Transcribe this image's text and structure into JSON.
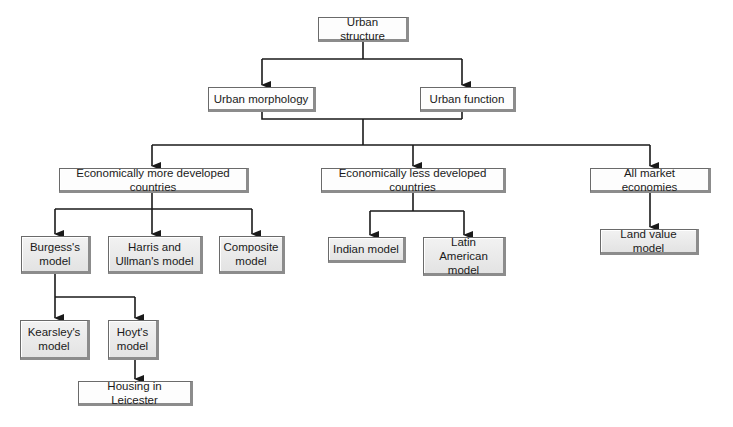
{
  "diagram": {
    "type": "hierarchy-flowchart",
    "colors": {
      "line": "#1a1a1a",
      "box_border": "#6a6a6a",
      "box_shadow": "#8c8c8c",
      "white_box_fill": "#fdfdfd",
      "grey_box_fill": "#e8e8e8",
      "text": "#1a1a1a"
    },
    "nodes": {
      "urban_structure": "Urban structure",
      "urban_morphology": "Urban morphology",
      "urban_function": "Urban function",
      "emdc": "Economically more developed countries",
      "eldc": "Economically less developed countries",
      "all_market": "All market economies",
      "burgess": "Burgess's\nmodel",
      "harris_ullman": "Harris and\nUllman's model",
      "composite": "Composite\nmodel",
      "indian": "Indian model",
      "latin_american": "Latin American\nmodel",
      "land_value": "Land value model",
      "kearsley": "Kearsley's\nmodel",
      "hoyt": "Hoyt's\nmodel",
      "housing_leicester": "Housing in Leicester"
    },
    "edges": [
      [
        "urban_structure",
        "urban_morphology"
      ],
      [
        "urban_structure",
        "urban_function"
      ],
      [
        "urban_morphology",
        "emdc"
      ],
      [
        "urban_morphology",
        "eldc"
      ],
      [
        "urban_morphology",
        "all_market"
      ],
      [
        "urban_function",
        "emdc"
      ],
      [
        "urban_function",
        "eldc"
      ],
      [
        "urban_function",
        "all_market"
      ],
      [
        "emdc",
        "burgess"
      ],
      [
        "emdc",
        "harris_ullman"
      ],
      [
        "emdc",
        "composite"
      ],
      [
        "eldc",
        "indian"
      ],
      [
        "eldc",
        "latin_american"
      ],
      [
        "all_market",
        "land_value"
      ],
      [
        "burgess",
        "kearsley"
      ],
      [
        "burgess",
        "hoyt"
      ],
      [
        "hoyt",
        "housing_leicester"
      ]
    ]
  }
}
